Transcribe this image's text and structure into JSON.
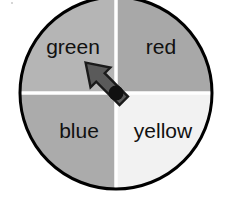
{
  "figure": {
    "name": "four-color-spinner",
    "type": "probability-spinner",
    "background_color": "#ffffff",
    "outline_color": "#000000",
    "divider_color": "#ffffff",
    "center": {
      "x": 116,
      "y": 93
    },
    "radius": 96
  },
  "spinner": {
    "sections": [
      {
        "label": "green",
        "position": "top-left",
        "fill": "#b5b5b5",
        "start_angle": 180,
        "end_angle": 270,
        "label_x": 73,
        "label_y": 48
      },
      {
        "label": "red",
        "position": "top-right",
        "fill": "#a8a8a8",
        "start_angle": 270,
        "end_angle": 360,
        "label_x": 161,
        "label_y": 48
      },
      {
        "label": "blue",
        "position": "bottom-left",
        "fill": "#ababab",
        "start_angle": 90,
        "end_angle": 180,
        "label_x": 79,
        "label_y": 132
      },
      {
        "label": "yellow",
        "position": "bottom-right",
        "fill": "#f2f2f2",
        "start_angle": 0,
        "end_angle": 90,
        "label_x": 163,
        "label_y": 132
      }
    ]
  },
  "pointer": {
    "name": "spinner-arrow",
    "fill": "#5a5a5a",
    "outline": "#1a1a1a",
    "pivot_fill": "#101010",
    "pivot_radius": 7,
    "points_to": "green",
    "direction": "up-left",
    "tip_x": 82,
    "tip_y": 56
  }
}
